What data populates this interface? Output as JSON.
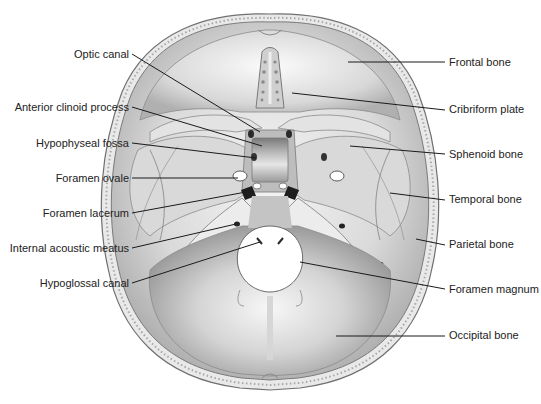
{
  "figure": {
    "colors": {
      "bone_light": "#f2f2f2",
      "bone_mid": "#c8c8c8",
      "bone_dark": "#8e8e8e",
      "outline": "#6a6a6a",
      "leader_line": "#1a1a1a",
      "label_text": "#222222",
      "background": "#ffffff"
    }
  },
  "labels": {
    "left": [
      {
        "id": "optic-canal",
        "text": "Optic canal"
      },
      {
        "id": "anterior-clinoid-process",
        "text": "Anterior clinoid process"
      },
      {
        "id": "hypophyseal-fossa",
        "text": "Hypophyseal fossa"
      },
      {
        "id": "foramen-ovale",
        "text": "Foramen ovale"
      },
      {
        "id": "foramen-lacerum",
        "text": "Foramen lacerum"
      },
      {
        "id": "internal-acoustic-meatus",
        "text": "Internal acoustic meatus"
      },
      {
        "id": "hypoglossal-canal",
        "text": "Hypoglossal canal"
      }
    ],
    "right": [
      {
        "id": "frontal-bone",
        "text": "Frontal bone"
      },
      {
        "id": "cribriform-plate",
        "text": "Cribriform plate"
      },
      {
        "id": "sphenoid-bone",
        "text": "Sphenoid bone"
      },
      {
        "id": "temporal-bone",
        "text": "Temporal bone"
      },
      {
        "id": "parietal-bone",
        "text": "Parietal bone"
      },
      {
        "id": "foramen-magnum",
        "text": "Foramen magnum"
      },
      {
        "id": "occipital-bone",
        "text": "Occipital bone"
      }
    ]
  }
}
